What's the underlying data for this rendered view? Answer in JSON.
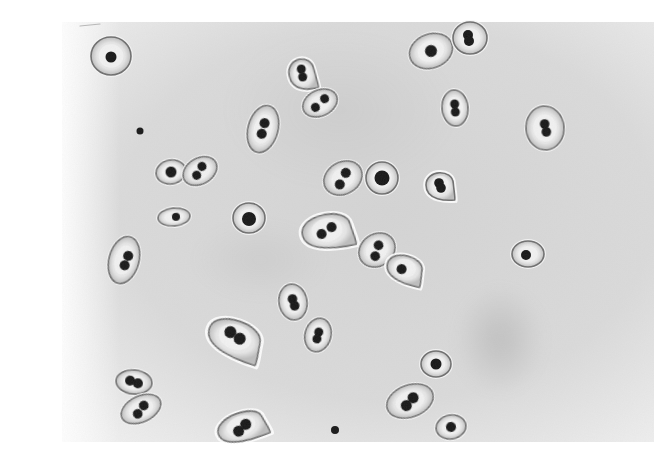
{
  "image": {
    "kind": "micrograph",
    "subject": "encapsulated diplococci (capsule stain)",
    "width": 670,
    "height": 456,
    "background_color": "#ffffff",
    "field_color": "#d9d9d9",
    "field_bounds": {
      "x": 62,
      "y": 22,
      "w": 592,
      "h": 420
    },
    "colors": {
      "capsule_fill": "#ececec",
      "capsule_halo": "#f6f6f6",
      "capsule_rim": "#6e6e6e",
      "coccus": "#141414"
    }
  },
  "cells": [
    {
      "id": 1,
      "cx": 111,
      "cy": 56,
      "rx": 20,
      "ry": 19,
      "rot": 0,
      "cocci": [
        [
          0,
          1
        ]
      ],
      "r": 5.5,
      "shape": "round"
    },
    {
      "id": 2,
      "cx": 302,
      "cy": 73,
      "rx": 13,
      "ry": 17,
      "rot": -10,
      "cocci": [
        [
          0,
          -4
        ],
        [
          0,
          4
        ]
      ],
      "r": 4.5,
      "shape": "teardrop"
    },
    {
      "id": 3,
      "cx": 320,
      "cy": 103,
      "rx": 18,
      "ry": 13,
      "rot": -25,
      "cocci": [
        [
          -6,
          2
        ],
        [
          6,
          -2
        ]
      ],
      "r": 4.5,
      "shape": "oval"
    },
    {
      "id": 4,
      "cx": 263,
      "cy": 129,
      "rx": 15,
      "ry": 24,
      "rot": 15,
      "cocci": [
        [
          0,
          -6
        ],
        [
          0,
          5
        ]
      ],
      "r": 5,
      "shape": "oval"
    },
    {
      "id": 5,
      "cx": 431,
      "cy": 51,
      "rx": 22,
      "ry": 17,
      "rot": -20,
      "cocci": [
        [
          0,
          0
        ]
      ],
      "r": 6,
      "shape": "oval"
    },
    {
      "id": 6,
      "cx": 470,
      "cy": 38,
      "rx": 17,
      "ry": 16,
      "rot": 0,
      "cocci": [
        [
          -2,
          -3
        ],
        [
          -1,
          3
        ]
      ],
      "r": 5,
      "shape": "round"
    },
    {
      "id": 7,
      "cx": 455,
      "cy": 108,
      "rx": 13,
      "ry": 18,
      "rot": -5,
      "cocci": [
        [
          0,
          -4
        ],
        [
          0,
          4
        ]
      ],
      "r": 4.5,
      "shape": "oval"
    },
    {
      "id": 8,
      "cx": 545,
      "cy": 128,
      "rx": 19,
      "ry": 22,
      "rot": -5,
      "cocci": [
        [
          0,
          -4
        ],
        [
          1,
          4
        ]
      ],
      "r": 4.8,
      "shape": "round"
    },
    {
      "id": 9,
      "cx": 171,
      "cy": 172,
      "rx": 15,
      "ry": 12,
      "rot": -10,
      "cocci": [
        [
          0,
          0
        ]
      ],
      "r": 5.5,
      "shape": "oval"
    },
    {
      "id": 10,
      "cx": 200,
      "cy": 171,
      "rx": 18,
      "ry": 13,
      "rot": -30,
      "cocci": [
        [
          -5,
          2
        ],
        [
          4,
          -3
        ]
      ],
      "r": 4.5,
      "shape": "oval"
    },
    {
      "id": 11,
      "cx": 343,
      "cy": 178,
      "rx": 20,
      "ry": 16,
      "rot": -30,
      "cocci": [
        [
          -6,
          4
        ],
        [
          5,
          -3
        ]
      ],
      "r": 5,
      "shape": "oval"
    },
    {
      "id": 12,
      "cx": 382,
      "cy": 178,
      "rx": 16,
      "ry": 16,
      "rot": 0,
      "cocci": [
        [
          0,
          0
        ]
      ],
      "r": 7.5,
      "shape": "round"
    },
    {
      "id": 13,
      "cx": 440,
      "cy": 185,
      "rx": 14,
      "ry": 15,
      "rot": 0,
      "cocci": [
        [
          -1,
          -2
        ],
        [
          1,
          3
        ]
      ],
      "r": 4.8,
      "shape": "teardrop"
    },
    {
      "id": 14,
      "cx": 174,
      "cy": 217,
      "rx": 16,
      "ry": 9,
      "rot": -5,
      "cocci": [
        [
          2,
          0
        ]
      ],
      "r": 4,
      "shape": "oval"
    },
    {
      "id": 15,
      "cx": 249,
      "cy": 218,
      "rx": 16,
      "ry": 15,
      "rot": 0,
      "cocci": [
        [
          0,
          1
        ]
      ],
      "r": 7,
      "shape": "round"
    },
    {
      "id": 16,
      "cx": 327,
      "cy": 230,
      "rx": 25,
      "ry": 19,
      "rot": -10,
      "cocci": [
        [
          -6,
          3
        ],
        [
          5,
          -2
        ]
      ],
      "r": 5,
      "shape": "teardrop"
    },
    {
      "id": 17,
      "cx": 377,
      "cy": 250,
      "rx": 19,
      "ry": 16,
      "rot": -35,
      "cocci": [
        [
          -5,
          4
        ],
        [
          4,
          -3
        ]
      ],
      "r": 4.8,
      "shape": "oval"
    },
    {
      "id": 18,
      "cx": 405,
      "cy": 268,
      "rx": 18,
      "ry": 15,
      "rot": 15,
      "cocci": [
        [
          -3,
          2
        ]
      ],
      "r": 5,
      "shape": "teardrop"
    },
    {
      "id": 19,
      "cx": 528,
      "cy": 254,
      "rx": 16,
      "ry": 13,
      "rot": 0,
      "cocci": [
        [
          -2,
          1
        ]
      ],
      "r": 5,
      "shape": "round"
    },
    {
      "id": 20,
      "cx": 124,
      "cy": 260,
      "rx": 15,
      "ry": 24,
      "rot": 15,
      "cocci": [
        [
          3,
          -5
        ],
        [
          2,
          5
        ]
      ],
      "r": 5,
      "shape": "oval"
    },
    {
      "id": 21,
      "cx": 293,
      "cy": 302,
      "rx": 14,
      "ry": 18,
      "rot": -10,
      "cocci": [
        [
          0,
          -3
        ],
        [
          1,
          4
        ]
      ],
      "r": 4.8,
      "shape": "oval"
    },
    {
      "id": 22,
      "cx": 318,
      "cy": 335,
      "rx": 13,
      "ry": 17,
      "rot": 15,
      "cocci": [
        [
          0,
          -3
        ],
        [
          0,
          4
        ]
      ],
      "r": 4.5,
      "shape": "oval"
    },
    {
      "id": 23,
      "cx": 235,
      "cy": 337,
      "rx": 27,
      "ry": 20,
      "rot": 20,
      "cocci": [
        [
          -6,
          -3
        ],
        [
          5,
          0
        ]
      ],
      "r": 6,
      "shape": "teardrop"
    },
    {
      "id": 24,
      "cx": 436,
      "cy": 364,
      "rx": 15,
      "ry": 13,
      "rot": 0,
      "cocci": [
        [
          0,
          0
        ]
      ],
      "r": 5.5,
      "shape": "round"
    },
    {
      "id": 25,
      "cx": 134,
      "cy": 382,
      "rx": 18,
      "ry": 12,
      "rot": 5,
      "cocci": [
        [
          -4,
          -1
        ],
        [
          4,
          1
        ]
      ],
      "r": 5,
      "shape": "oval"
    },
    {
      "id": 26,
      "cx": 141,
      "cy": 409,
      "rx": 21,
      "ry": 13,
      "rot": -25,
      "cocci": [
        [
          -5,
          3
        ],
        [
          4,
          -2
        ]
      ],
      "r": 4.8,
      "shape": "oval"
    },
    {
      "id": 27,
      "cx": 410,
      "cy": 401,
      "rx": 24,
      "ry": 16,
      "rot": -20,
      "cocci": [
        [
          -5,
          3
        ],
        [
          4,
          -2
        ]
      ],
      "r": 5.5,
      "shape": "oval"
    },
    {
      "id": 28,
      "cx": 241,
      "cy": 426,
      "rx": 24,
      "ry": 16,
      "rot": -20,
      "cocci": [
        [
          -4,
          4
        ],
        [
          5,
          0
        ]
      ],
      "r": 5.5,
      "shape": "teardrop"
    },
    {
      "id": 29,
      "cx": 451,
      "cy": 427,
      "rx": 15,
      "ry": 12,
      "rot": -10,
      "cocci": [
        [
          0,
          0
        ]
      ],
      "r": 5,
      "shape": "round"
    }
  ],
  "debris": [
    {
      "cx": 140,
      "cy": 131,
      "r": 3.5
    },
    {
      "cx": 335,
      "cy": 430,
      "r": 4
    }
  ],
  "smudges": [
    {
      "cx": 500,
      "cy": 340,
      "rx": 45,
      "ry": 55,
      "opacity": 0.28
    },
    {
      "cx": 340,
      "cy": 110,
      "rx": 120,
      "ry": 80,
      "opacity": 0.1
    },
    {
      "cx": 260,
      "cy": 260,
      "rx": 70,
      "ry": 40,
      "opacity": 0.1
    }
  ],
  "marks": [
    {
      "x1": 80,
      "y1": 26,
      "x2": 100,
      "y2": 24
    }
  ]
}
